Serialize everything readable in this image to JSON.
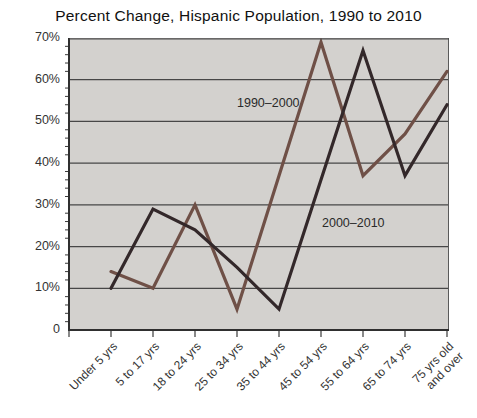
{
  "title": "Percent Change, Hispanic Population, 1990 to 2010",
  "chart_data": {
    "type": "line",
    "categories": [
      "Under 5 yrs",
      "5 to 17 yrs",
      "18 to 24 yrs",
      "25 to 34 yrs",
      "35 to 44 yrs",
      "45 to 54 yrs",
      "55 to 64 yrs",
      "65 to 74 yrs",
      "75 yrs old\nand over"
    ],
    "series": [
      {
        "name": "1990–2000",
        "color": "#6f5047",
        "values": [
          14,
          10,
          30,
          5,
          37,
          69,
          37,
          47,
          62
        ]
      },
      {
        "name": "2000–2010",
        "color": "#33282a",
        "values": [
          10,
          29,
          24,
          15,
          5,
          36,
          67,
          37,
          54
        ]
      }
    ],
    "ylim": [
      0,
      70
    ],
    "ytick_labels": [
      "70%",
      "60%",
      "50%",
      "40%",
      "30%",
      "20%",
      "10%",
      "0"
    ],
    "ytick_step": 10,
    "minor_tick_step": 2,
    "grid": true,
    "legend_position": "inline-annotations",
    "plot_bg": "#d3d1ce",
    "grid_color": "#474747",
    "axis_color": "#2f2f2f",
    "text_color": "#333333"
  }
}
